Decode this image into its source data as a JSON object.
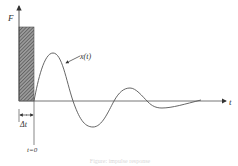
{
  "diagram": {
    "labels": {
      "y_axis": "F",
      "x_axis": "t",
      "response": "x(t)",
      "impulse_duration": "Δt",
      "origin_time": "t=0"
    },
    "caption": "Figure: impulse response",
    "colors": {
      "line": "#555555",
      "hatch": "#666666",
      "background": "#ffffff"
    },
    "elements": [
      "vertical F axis with arrow",
      "horizontal t axis with arrow",
      "hatched rectangular impulse of width Δt",
      "damped oscillation curve x(t)",
      "Δt dimension arrows",
      "t=0 reference line"
    ]
  }
}
